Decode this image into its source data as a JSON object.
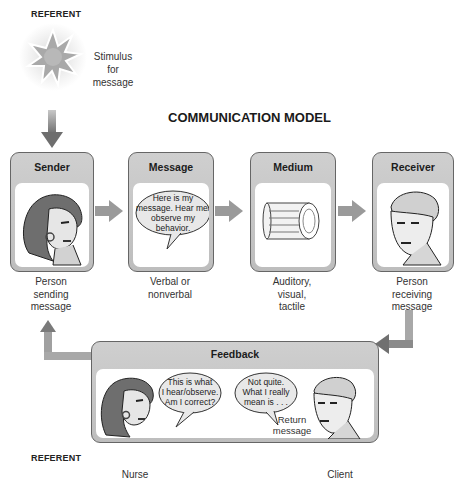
{
  "referent_top": "REFERENT",
  "stimulus": {
    "lines": [
      "Stimulus",
      "for",
      "message"
    ]
  },
  "title": "COMMUNICATION MODEL",
  "boxes": [
    {
      "header": "Sender",
      "caption": [
        "Person",
        "sending",
        "message"
      ]
    },
    {
      "header": "Message",
      "bubble": [
        "Here is my",
        "message. Hear me/",
        "observe my",
        "behavior."
      ],
      "caption": [
        "Verbal or",
        "nonverbal"
      ]
    },
    {
      "header": "Medium",
      "caption": [
        "Auditory,",
        "visual,",
        "tactile"
      ]
    },
    {
      "header": "Receiver",
      "caption": [
        "Person",
        "receiving",
        "message"
      ]
    }
  ],
  "feedback": {
    "header": "Feedback",
    "nurse_bubble": [
      "This is what",
      "I hear/observe.",
      "Am I correct?"
    ],
    "client_bubble": [
      "Not quite.",
      "What I really",
      "mean is . . ."
    ],
    "return_label": [
      "Return",
      "message"
    ],
    "nurse_label": "Nurse",
    "client_label": "Client"
  },
  "referent_bottom": "REFERENT",
  "colors": {
    "header_gray": "#c4c4c4",
    "border": "#666666",
    "arrow": "#8a8a8a"
  }
}
